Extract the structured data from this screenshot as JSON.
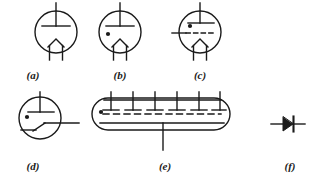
{
  "figure": {
    "type": "electronic-schematic-symbol-plate",
    "background_color": "#ffffff",
    "ink_color": "#1a1a1a",
    "width": 316,
    "height": 187,
    "symbols": [
      {
        "id": "a",
        "label": "(a)",
        "name": "vacuum-diode-symbol",
        "description": "vacuum tube diode: envelope circle with plate and filament cathode",
        "label_x": 33,
        "label_y": 76,
        "center_x": 56,
        "center_y": 32,
        "radius": 21,
        "has_gas_dot": false,
        "has_grid": false,
        "has_diagonal": false,
        "plate_lead_top_y": 3
      },
      {
        "id": "b",
        "label": "(b)",
        "name": "gas-filled-diode-symbol",
        "description": "gas-filled diode: envelope circle with plate, filament cathode and gas dot",
        "label_x": 120,
        "label_y": 76,
        "center_x": 120,
        "center_y": 32,
        "radius": 21,
        "has_gas_dot": true,
        "has_grid": false,
        "has_diagonal": false,
        "plate_lead_top_y": 3
      },
      {
        "id": "c",
        "label": "(c)",
        "name": "thyratron-triode-symbol",
        "description": "gas triode / thyratron: envelope circle with plate, dashed grid lead, gas dot and filament cathode",
        "label_x": 200,
        "label_y": 76,
        "center_x": 200,
        "center_y": 32,
        "radius": 21,
        "has_gas_dot": true,
        "has_grid": true,
        "has_diagonal": false,
        "plate_lead_top_y": 3
      },
      {
        "id": "d",
        "label": "(d)",
        "name": "gas-tube-shield-grid-symbol",
        "description": "gas tube with plate, gas dot and inclined shield-grid lead to the right",
        "label_x": 33,
        "label_y": 167,
        "center_x": 40,
        "center_y": 118,
        "radius": 21,
        "has_gas_dot": true,
        "has_grid": false,
        "has_diagonal": true,
        "plate_lead_top_y": 92
      },
      {
        "id": "e",
        "label": "(e)",
        "name": "multi-anode-gas-rectifier-symbol",
        "description": "multi-anode gas-filled rectifier tube: elongated stadium envelope with six anodes, dashed grid, gas dot and cathode lead",
        "label_x": 165,
        "label_y": 167,
        "anode_count": 6,
        "has_gas_dot": true,
        "has_grid": true
      },
      {
        "id": "f",
        "label": "(f)",
        "name": "semiconductor-diode-symbol",
        "description": "semiconductor diode: filled triangle anode pointing right into cathode bar",
        "label_x": 290,
        "label_y": 167,
        "center_x": 287,
        "center_y": 124
      }
    ]
  }
}
